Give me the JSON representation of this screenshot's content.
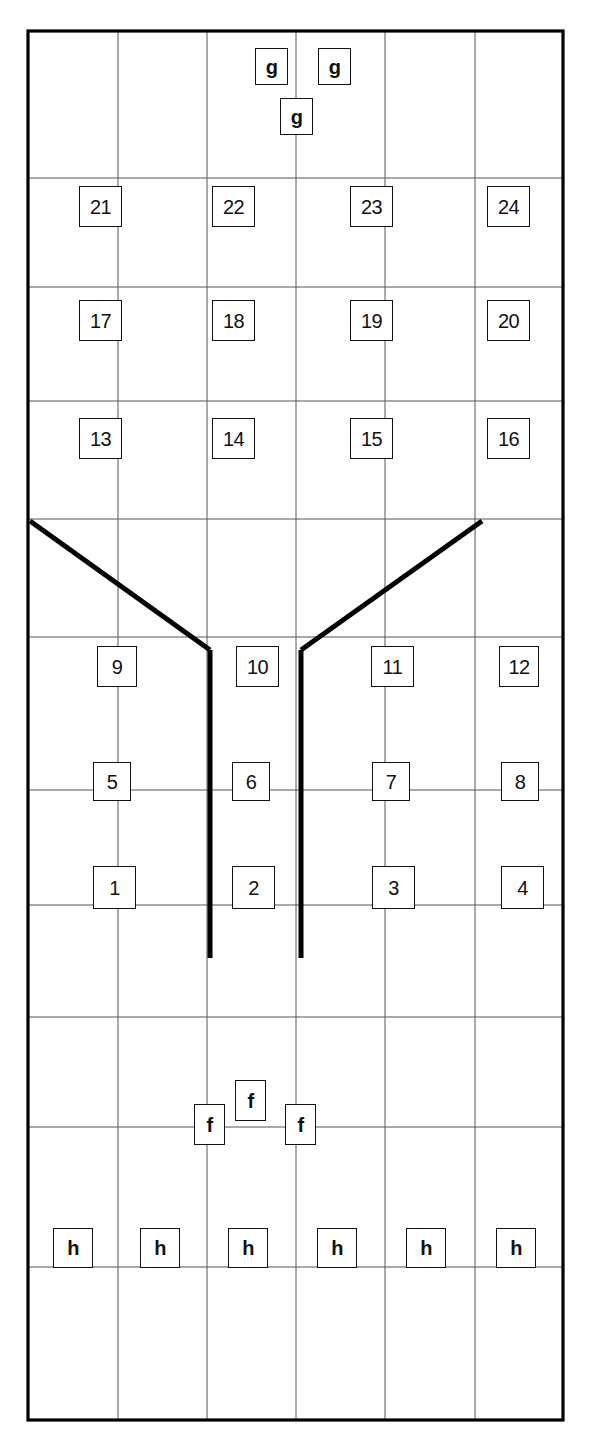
{
  "diagram": {
    "type": "engineering-grid-schematic",
    "canvas": {
      "width": 591,
      "height": 1448
    },
    "colors": {
      "background": "#ffffff",
      "ink": "#111111",
      "grid_line": "#555555",
      "heavy_line": "#000000"
    },
    "frame": {
      "x": 28,
      "y": 31,
      "width": 535,
      "height": 1389,
      "stroke_width": 3.2
    },
    "grid": {
      "column_x": [
        28,
        118,
        207,
        296,
        385,
        475,
        563
      ],
      "row_y": [
        31,
        178,
        287,
        401,
        519,
        637,
        790,
        905,
        1017,
        1127,
        1267,
        1420
      ],
      "columns": 6,
      "rows": 11,
      "line_width": 1.0
    },
    "heavy_lines": [
      {
        "name": "left-diagonal",
        "x1": 30,
        "y1": 521,
        "x2": 210,
        "y2": 650
      },
      {
        "name": "right-diagonal",
        "x1": 301,
        "y1": 650,
        "x2": 482,
        "y2": 521
      },
      {
        "name": "left-vertical",
        "x1": 210,
        "y1": 650,
        "x2": 210,
        "y2": 958
      },
      {
        "name": "right-vertical",
        "x1": 301,
        "y1": 650,
        "x2": 301,
        "y2": 958
      }
    ],
    "labels": [
      {
        "text": "g",
        "kind": "ltr",
        "x": 255,
        "y": 48,
        "w": 33,
        "h": 37
      },
      {
        "text": "g",
        "kind": "ltr",
        "x": 318,
        "y": 48,
        "w": 33,
        "h": 37
      },
      {
        "text": "g",
        "kind": "ltr",
        "x": 280,
        "y": 98,
        "w": 33,
        "h": 37
      },
      {
        "text": "21",
        "kind": "num",
        "x": 79,
        "y": 186,
        "w": 43,
        "h": 41
      },
      {
        "text": "22",
        "kind": "num",
        "x": 212,
        "y": 186,
        "w": 43,
        "h": 41
      },
      {
        "text": "23",
        "kind": "num",
        "x": 350,
        "y": 186,
        "w": 43,
        "h": 41
      },
      {
        "text": "24",
        "kind": "num",
        "x": 487,
        "y": 186,
        "w": 43,
        "h": 41
      },
      {
        "text": "17",
        "kind": "num",
        "x": 79,
        "y": 300,
        "w": 43,
        "h": 41
      },
      {
        "text": "18",
        "kind": "num",
        "x": 212,
        "y": 300,
        "w": 43,
        "h": 41
      },
      {
        "text": "19",
        "kind": "num",
        "x": 350,
        "y": 300,
        "w": 43,
        "h": 41
      },
      {
        "text": "20",
        "kind": "num",
        "x": 487,
        "y": 300,
        "w": 43,
        "h": 41
      },
      {
        "text": "13",
        "kind": "num",
        "x": 79,
        "y": 418,
        "w": 43,
        "h": 41
      },
      {
        "text": "14",
        "kind": "num",
        "x": 212,
        "y": 418,
        "w": 43,
        "h": 41
      },
      {
        "text": "15",
        "kind": "num",
        "x": 350,
        "y": 418,
        "w": 43,
        "h": 41
      },
      {
        "text": "16",
        "kind": "num",
        "x": 487,
        "y": 418,
        "w": 43,
        "h": 41
      },
      {
        "text": "9",
        "kind": "num",
        "x": 97,
        "y": 646,
        "w": 40,
        "h": 41
      },
      {
        "text": "10",
        "kind": "num",
        "x": 236,
        "y": 646,
        "w": 43,
        "h": 41
      },
      {
        "text": "11",
        "kind": "num",
        "x": 371,
        "y": 646,
        "w": 43,
        "h": 41
      },
      {
        "text": "12",
        "kind": "num",
        "x": 499,
        "y": 646,
        "w": 40,
        "h": 41
      },
      {
        "text": "5",
        "kind": "num",
        "x": 93,
        "y": 762,
        "w": 38,
        "h": 39
      },
      {
        "text": "6",
        "kind": "num",
        "x": 232,
        "y": 762,
        "w": 38,
        "h": 39
      },
      {
        "text": "7",
        "kind": "num",
        "x": 372,
        "y": 762,
        "w": 38,
        "h": 39
      },
      {
        "text": "8",
        "kind": "num",
        "x": 501,
        "y": 762,
        "w": 38,
        "h": 39
      },
      {
        "text": "1",
        "kind": "num",
        "x": 93,
        "y": 866,
        "w": 43,
        "h": 43
      },
      {
        "text": "2",
        "kind": "num",
        "x": 232,
        "y": 866,
        "w": 43,
        "h": 43
      },
      {
        "text": "3",
        "kind": "num",
        "x": 372,
        "y": 866,
        "w": 43,
        "h": 43
      },
      {
        "text": "4",
        "kind": "num",
        "x": 501,
        "y": 866,
        "w": 43,
        "h": 43
      },
      {
        "text": "f",
        "kind": "ltr",
        "x": 194,
        "y": 1104,
        "w": 31,
        "h": 41
      },
      {
        "text": "f",
        "kind": "ltr",
        "x": 235,
        "y": 1080,
        "w": 31,
        "h": 41
      },
      {
        "text": "f",
        "kind": "ltr",
        "x": 285,
        "y": 1104,
        "w": 31,
        "h": 41
      },
      {
        "text": "h",
        "kind": "ltr",
        "x": 53,
        "y": 1228,
        "w": 40,
        "h": 40
      },
      {
        "text": "h",
        "kind": "ltr",
        "x": 140,
        "y": 1228,
        "w": 40,
        "h": 40
      },
      {
        "text": "h",
        "kind": "ltr",
        "x": 228,
        "y": 1228,
        "w": 40,
        "h": 40
      },
      {
        "text": "h",
        "kind": "ltr",
        "x": 317,
        "y": 1228,
        "w": 40,
        "h": 40
      },
      {
        "text": "h",
        "kind": "ltr",
        "x": 406,
        "y": 1228,
        "w": 40,
        "h": 40
      },
      {
        "text": "h",
        "kind": "ltr",
        "x": 496,
        "y": 1228,
        "w": 40,
        "h": 40
      }
    ]
  }
}
